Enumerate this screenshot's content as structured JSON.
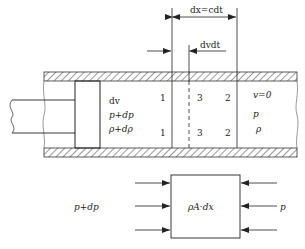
{
  "dimensions": {
    "dx_label": "dx=cdt",
    "dvdt_label": "dvdt"
  },
  "left_region": {
    "velocity": "dv",
    "pressure": "p+dp",
    "density": "ρ+dρ"
  },
  "section_markers": {
    "s1_top": "1",
    "s3_top": "3",
    "s2_top": "2",
    "s1_bot": "1",
    "s3_bot": "3",
    "s2_bot": "2"
  },
  "right_region": {
    "velocity": "v=0",
    "pressure": "p",
    "density": "ρ"
  },
  "free_body": {
    "left_label": "p+dp",
    "box_label": "ρA·dx",
    "right_label": "p"
  }
}
